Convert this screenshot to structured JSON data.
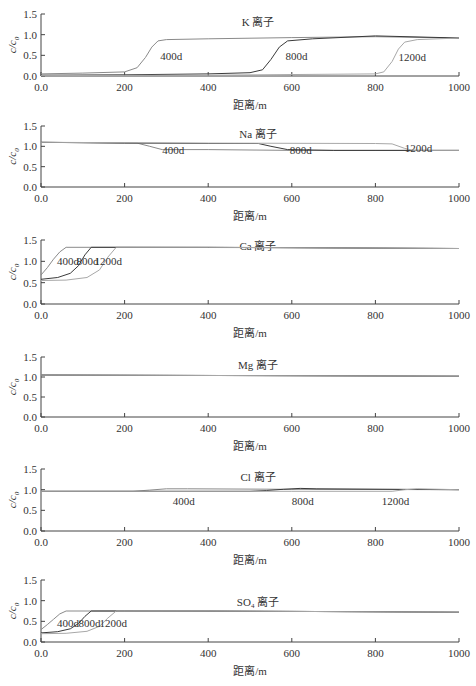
{
  "figure": {
    "panel_count": 6,
    "shared_xlabel": "距离/m",
    "shared_ylabel": "c/c0"
  },
  "colors": {
    "axis": "#444444",
    "s400": "#8a8a8a",
    "s800": "#3a3a3a",
    "s1200": "#a8a8a8"
  },
  "chart_data": [
    {
      "type": "line",
      "title": "K 离子",
      "xlabel": "距离/m",
      "ylabel": "c/c0",
      "xlim": [
        0,
        1000
      ],
      "ylim": [
        0,
        1.5
      ],
      "xticks": [
        "0.0",
        "200",
        "400",
        "600",
        "800",
        "1000"
      ],
      "yticks": [
        "0.0",
        "0.5",
        "1.0",
        "1.5"
      ],
      "grid": false,
      "series": [
        {
          "name": "400d",
          "x": [
            0,
            100,
            200,
            230,
            250,
            265,
            280,
            300,
            400,
            600,
            800,
            1000
          ],
          "y": [
            0.05,
            0.07,
            0.1,
            0.2,
            0.45,
            0.7,
            0.85,
            0.88,
            0.9,
            0.93,
            0.95,
            0.92
          ]
        },
        {
          "name": "800d",
          "x": [
            0,
            200,
            400,
            500,
            530,
            550,
            570,
            590,
            650,
            800,
            1000
          ],
          "y": [
            0.02,
            0.03,
            0.05,
            0.08,
            0.15,
            0.4,
            0.7,
            0.85,
            0.9,
            0.97,
            0.92
          ]
        },
        {
          "name": "1200d",
          "x": [
            0,
            400,
            800,
            820,
            840,
            855,
            870,
            900,
            1000
          ],
          "y": [
            0.01,
            0.02,
            0.05,
            0.1,
            0.35,
            0.65,
            0.82,
            0.88,
            0.92
          ]
        }
      ],
      "labels": [
        {
          "text": "400d",
          "x": 285,
          "y": 0.48
        },
        {
          "text": "800d",
          "x": 585,
          "y": 0.48
        },
        {
          "text": "1200d",
          "x": 855,
          "y": 0.46
        }
      ]
    },
    {
      "type": "line",
      "title": "Na 离子",
      "xlabel": "距离/m",
      "ylabel": "c/c0",
      "xlim": [
        0,
        1000
      ],
      "ylim": [
        0,
        1.5
      ],
      "xticks": [
        "0.0",
        "200",
        "400",
        "600",
        "800",
        "1000"
      ],
      "yticks": [
        "0.0",
        "0.5",
        "1.0",
        "1.5"
      ],
      "grid": false,
      "series": [
        {
          "name": "400d",
          "x": [
            0,
            230,
            260,
            290,
            400,
            600,
            800,
            1000
          ],
          "y": [
            1.1,
            1.08,
            1.0,
            0.92,
            0.92,
            0.9,
            0.9,
            0.9
          ]
        },
        {
          "name": "800d",
          "x": [
            0,
            200,
            400,
            520,
            550,
            590,
            700,
            1000
          ],
          "y": [
            1.1,
            1.08,
            1.07,
            1.07,
            1.0,
            0.92,
            0.9,
            0.9
          ]
        },
        {
          "name": "1200d",
          "x": [
            0,
            400,
            800,
            840,
            870,
            890,
            1000
          ],
          "y": [
            1.1,
            1.08,
            1.07,
            1.06,
            0.95,
            0.9,
            0.9
          ]
        }
      ],
      "labels": [
        {
          "text": "400d",
          "x": 290,
          "y": 0.9
        },
        {
          "text": "800d",
          "x": 595,
          "y": 0.9
        },
        {
          "text": "1200d",
          "x": 870,
          "y": 0.95
        }
      ]
    },
    {
      "type": "line",
      "title": "Ca 离子",
      "xlabel": "距离/m",
      "ylabel": "c/c0",
      "xlim": [
        0,
        1000
      ],
      "ylim": [
        0,
        1.5
      ],
      "xticks": [
        "0.0",
        "200",
        "400",
        "600",
        "800",
        "1000"
      ],
      "yticks": [
        "0.0",
        "0.5",
        "1.0",
        "1.5"
      ],
      "grid": false,
      "series": [
        {
          "name": "400d",
          "x": [
            0,
            15,
            30,
            45,
            60,
            200,
            600,
            1000
          ],
          "y": [
            0.68,
            0.85,
            1.05,
            1.22,
            1.33,
            1.33,
            1.32,
            1.3
          ]
        },
        {
          "name": "800d",
          "x": [
            0,
            40,
            70,
            90,
            105,
            120,
            400,
            1000
          ],
          "y": [
            0.58,
            0.62,
            0.72,
            0.9,
            1.15,
            1.33,
            1.33,
            1.3
          ]
        },
        {
          "name": "1200d",
          "x": [
            0,
            60,
            110,
            140,
            160,
            180,
            400,
            1000
          ],
          "y": [
            0.55,
            0.56,
            0.62,
            0.8,
            1.1,
            1.33,
            1.33,
            1.3
          ]
        }
      ],
      "labels": [
        {
          "text": "400d",
          "x": 38,
          "y": 1.0
        },
        {
          "text": "800d",
          "x": 85,
          "y": 1.0
        },
        {
          "text": "1200d",
          "x": 128,
          "y": 1.0
        }
      ]
    },
    {
      "type": "line",
      "title": "Mg 离子",
      "xlabel": "距离/m",
      "ylabel": "c/c0",
      "xlim": [
        0,
        1000
      ],
      "ylim": [
        0,
        1.5
      ],
      "xticks": [
        "0.0",
        "200",
        "400",
        "600",
        "800",
        "1000"
      ],
      "yticks": [
        "0.0",
        "0.5",
        "1.0",
        "1.5"
      ],
      "grid": false,
      "series": [
        {
          "name": "400d",
          "x": [
            0,
            1000
          ],
          "y": [
            1.05,
            1.02
          ]
        },
        {
          "name": "800d",
          "x": [
            0,
            1000
          ],
          "y": [
            1.05,
            1.02
          ]
        },
        {
          "name": "1200d",
          "x": [
            0,
            1000
          ],
          "y": [
            1.05,
            1.02
          ]
        }
      ],
      "labels": []
    },
    {
      "type": "line",
      "title": "Cl 离子",
      "xlabel": "距离/m",
      "ylabel": "c/c0",
      "xlim": [
        0,
        1000
      ],
      "ylim": [
        0,
        1.5
      ],
      "xticks": [
        "0.0",
        "200",
        "400",
        "600",
        "800",
        "1000"
      ],
      "yticks": [
        "0.0",
        "0.5",
        "1.0",
        "1.5"
      ],
      "grid": false,
      "series": [
        {
          "name": "400d",
          "x": [
            0,
            220,
            260,
            300,
            350,
            600,
            1000
          ],
          "y": [
            0.96,
            0.96,
            0.99,
            1.02,
            1.02,
            1.01,
            1.0
          ]
        },
        {
          "name": "800d",
          "x": [
            0,
            500,
            540,
            580,
            620,
            660,
            1000
          ],
          "y": [
            0.96,
            0.96,
            0.98,
            1.01,
            1.03,
            1.02,
            1.0
          ]
        },
        {
          "name": "1200d",
          "x": [
            0,
            600,
            840,
            870,
            900,
            1000
          ],
          "y": [
            0.96,
            0.96,
            0.96,
            1.0,
            1.02,
            1.0
          ]
        }
      ],
      "labels": [
        {
          "text": "400d",
          "x": 315,
          "y": 0.72
        },
        {
          "text": "800d",
          "x": 600,
          "y": 0.72
        },
        {
          "text": "1200d",
          "x": 815,
          "y": 0.72
        }
      ]
    },
    {
      "type": "line",
      "title": "SO4 离子",
      "xlabel": "距离/m",
      "ylabel": "c/c0",
      "xlim": [
        0,
        1000
      ],
      "ylim": [
        0,
        1.5
      ],
      "xticks": [
        "0.0",
        "200",
        "400",
        "600",
        "800",
        "1000"
      ],
      "yticks": [
        "0.0",
        "0.5",
        "1.0",
        "1.5"
      ],
      "grid": false,
      "series": [
        {
          "name": "400d",
          "x": [
            0,
            15,
            30,
            45,
            60,
            200,
            600,
            1000
          ],
          "y": [
            0.3,
            0.42,
            0.55,
            0.68,
            0.75,
            0.75,
            0.74,
            0.72
          ]
        },
        {
          "name": "800d",
          "x": [
            0,
            40,
            70,
            90,
            105,
            120,
            400,
            1000
          ],
          "y": [
            0.22,
            0.25,
            0.32,
            0.45,
            0.62,
            0.75,
            0.75,
            0.72
          ]
        },
        {
          "name": "1200d",
          "x": [
            0,
            60,
            110,
            140,
            160,
            180,
            400,
            1000
          ],
          "y": [
            0.2,
            0.21,
            0.26,
            0.38,
            0.58,
            0.75,
            0.75,
            0.72
          ]
        }
      ],
      "labels": [
        {
          "text": "400d",
          "x": 38,
          "y": 0.47
        },
        {
          "text": "800d",
          "x": 90,
          "y": 0.47
        },
        {
          "text": "1200d",
          "x": 140,
          "y": 0.47
        }
      ]
    }
  ]
}
